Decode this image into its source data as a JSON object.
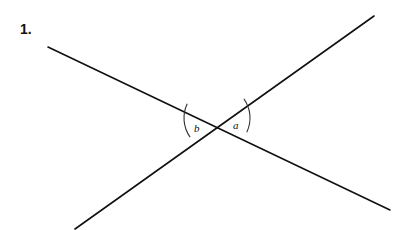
{
  "problem": {
    "number": "1."
  },
  "diagram": {
    "line_color": "#111111",
    "arc_color": "#333333",
    "lines": [
      {
        "x1": 48,
        "y1": 47,
        "x2": 390,
        "y2": 210
      },
      {
        "x1": 75,
        "y1": 229,
        "x2": 374,
        "y2": 16
      }
    ],
    "intersection": {
      "x": 217,
      "y": 118
    },
    "angles": [
      {
        "label": "b",
        "x": 197,
        "y": 132
      },
      {
        "label": "a",
        "x": 233,
        "y": 129
      }
    ]
  }
}
